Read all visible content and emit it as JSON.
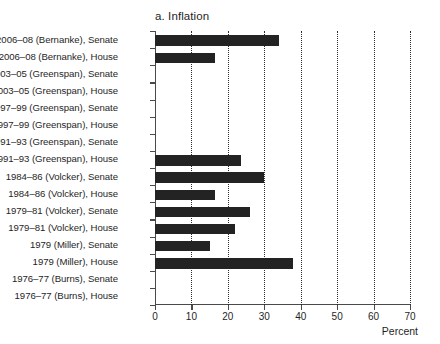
{
  "chart_data": {
    "type": "bar",
    "orientation": "horizontal",
    "title": "a. Inflation",
    "xlabel": "Percent",
    "ylabel": "",
    "xlim": [
      0,
      70
    ],
    "xticks": [
      0,
      10,
      20,
      30,
      40,
      50,
      60,
      70
    ],
    "xticklabels": [
      "0",
      "10",
      "20",
      "30",
      "40",
      "50",
      "60",
      "70"
    ],
    "grid": "vertical-dotted",
    "legend": "none",
    "bar_color": "#232323",
    "categories": [
      "2006–08 (Bernanke), Senate",
      "2006–08 (Bernanke), House",
      "2003–05 (Greenspan), Senate",
      "2003–05 (Greenspan), House",
      "1997–99 (Greenspan), Senate",
      "1997–99 (Greenspan), House",
      "1991–93 (Greenspan), Senate",
      "1991–93 (Greenspan), House",
      "1984–86 (Volcker), Senate",
      "1984–86 (Volcker), House",
      "1979–81 (Volcker), Senate",
      "1979–81 (Volcker), House",
      "1979 (Miller), Senate",
      "1979 (Miller), House",
      "1976–77 (Burns), Senate",
      "1976–77 (Burns), House"
    ],
    "values": [
      34,
      16.5,
      0,
      0,
      0,
      0,
      0,
      23.5,
      30,
      16.5,
      26,
      22,
      15,
      38,
      0,
      0
    ]
  }
}
